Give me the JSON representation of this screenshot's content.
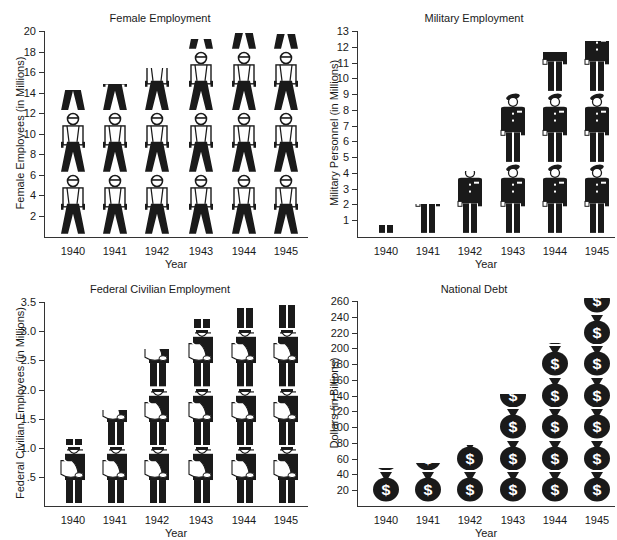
{
  "chart_data": [
    {
      "type": "bar",
      "style": "pictograph",
      "title": "Female Employment",
      "xlabel": "Year",
      "ylabel": "Female Employees (in Millions)",
      "categories": [
        "1940",
        "1941",
        "1942",
        "1943",
        "1944",
        "1945"
      ],
      "values": [
        14.0,
        14.6,
        16.1,
        18.9,
        19.5,
        19.4
      ],
      "ylim": [
        0,
        20
      ],
      "yticks": [
        "2",
        "4",
        "6",
        "8",
        "10",
        "12",
        "14",
        "16",
        "18",
        "20"
      ],
      "icon": "female-worker-icon",
      "icon_unit": 6
    },
    {
      "type": "bar",
      "style": "pictograph",
      "title": "Military Employment",
      "xlabel": "Year",
      "ylabel": "Military Personnel (in Millions)",
      "categories": [
        "1940",
        "1941",
        "1942",
        "1943",
        "1944",
        "1945"
      ],
      "values": [
        0.5,
        1.8,
        3.9,
        9.0,
        11.5,
        12.2
      ],
      "ylim": [
        0,
        13
      ],
      "yticks": [
        "1",
        "2",
        "3",
        "4",
        "5",
        "6",
        "7",
        "8",
        "9",
        "10",
        "11",
        "12",
        "13"
      ],
      "icon": "soldier-icon",
      "icon_unit": 4.5
    },
    {
      "type": "bar",
      "style": "pictograph",
      "title": "Federal Civilian Employment",
      "xlabel": "Year",
      "ylabel": "Federal Civilian Employees (in Millions)",
      "categories": [
        "1940",
        "1941",
        "1942",
        "1943",
        "1944",
        "1945"
      ],
      "values": [
        1.1,
        1.6,
        2.65,
        3.15,
        3.35,
        3.4
      ],
      "ylim": [
        0,
        3.5
      ],
      "yticks": [
        ".5",
        "1.0",
        "1.5",
        "2.0",
        "2.5",
        "3.0",
        "3.5"
      ],
      "icon": "mail-carrier-icon",
      "icon_unit": 1.0
    },
    {
      "type": "bar",
      "style": "pictograph",
      "title": "National Debt",
      "xlabel": "Year",
      "ylabel": "Dollars (in Billions)",
      "categories": [
        "1940",
        "1941",
        "1942",
        "1943",
        "1944",
        "1945"
      ],
      "values": [
        43,
        49,
        72,
        137,
        201,
        259
      ],
      "ylim": [
        0,
        260
      ],
      "yticks": [
        "20",
        "40",
        "60",
        "80",
        "100",
        "120",
        "140",
        "160",
        "180",
        "200",
        "220",
        "240",
        "260"
      ],
      "icon": "money-bag-icon",
      "icon_unit": 40
    }
  ],
  "colors": {
    "ink": "#1a1a1a",
    "background": "#ffffff"
  }
}
